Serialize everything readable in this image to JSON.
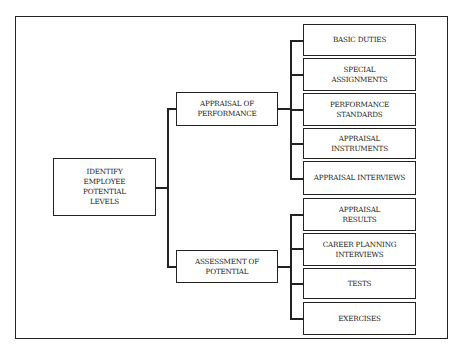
{
  "diagram": {
    "root": {
      "label": "IDENTIFY\nEMPLOYEE\nPOTENTIAL\nLEVELS"
    },
    "branches": [
      {
        "label": "APPRAISAL OF\nPERFORMANCE",
        "children": [
          {
            "label": "BASIC DUTIES"
          },
          {
            "label": "SPECIAL\nASSIGNMENTS"
          },
          {
            "label": "PERFORMANCE\nSTANDARDS"
          },
          {
            "label": "APPRAISAL\nINSTRUMENTS"
          },
          {
            "label": "APPRAISAL INTERVIEWS"
          }
        ]
      },
      {
        "label": "ASSESSMENT OF\nPOTENTIAL",
        "children": [
          {
            "label": "APPRAISAL\nRESULTS"
          },
          {
            "label": "CAREER PLANNING\nINTERVIEWS"
          },
          {
            "label": "TESTS"
          },
          {
            "label": "EXERCISES"
          }
        ]
      }
    ]
  }
}
